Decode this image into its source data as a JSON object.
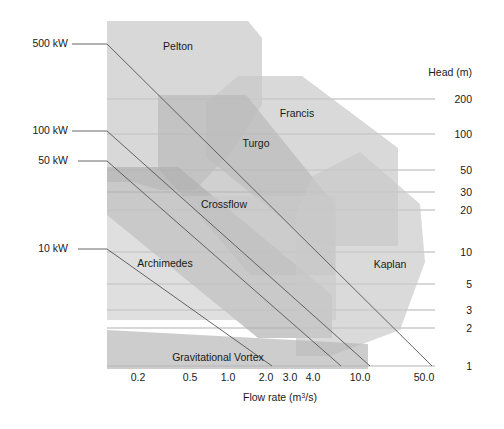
{
  "chart_data": {
    "type": "area",
    "title": "",
    "xlabel": "Flow rate (m3/s)",
    "ylabel": "Head (m)",
    "xlabel_prefix": "Flow rate (m",
    "xlabel_sup": "3",
    "xlabel_suffix": "/s)",
    "x_scale": "log",
    "y_scale": "log",
    "xlim": [
      0.12,
      80
    ],
    "ylim": [
      0.8,
      400
    ],
    "grid": true,
    "legend": "none",
    "x_ticks": [
      {
        "value": 0.2,
        "label": "0.2",
        "px": 138
      },
      {
        "value": 0.5,
        "label": "0.5",
        "px": 190
      },
      {
        "value": 1.0,
        "label": "1.0",
        "px": 228
      },
      {
        "value": 2.0,
        "label": "2.0",
        "px": 266
      },
      {
        "value": 3.0,
        "label": "3.0",
        "px": 290
      },
      {
        "value": 4.0,
        "label": "4.0",
        "px": 313
      },
      {
        "value": 10.0,
        "label": "10.0",
        "px": 360
      },
      {
        "value": 50.0,
        "label": "50.0",
        "px": 424
      }
    ],
    "y_ticks": [
      {
        "value": 200,
        "label": "200",
        "px": 99
      },
      {
        "value": 100,
        "label": "100",
        "px": 134
      },
      {
        "value": 50,
        "label": "50",
        "px": 170
      },
      {
        "value": 30,
        "label": "30",
        "px": 192
      },
      {
        "value": 20,
        "label": "20",
        "px": 210
      },
      {
        "value": 10,
        "label": "10",
        "px": 252
      },
      {
        "value": 5,
        "label": "5",
        "px": 284
      },
      {
        "value": 3,
        "label": "3",
        "px": 310
      },
      {
        "value": 2,
        "label": "2",
        "px": 328
      },
      {
        "value": 1,
        "label": "1",
        "px": 366
      }
    ],
    "power_lines": [
      {
        "label": "500 kW",
        "label_px": {
          "x": 68,
          "y": 47
        },
        "leader": [
          [
            72,
            44
          ],
          [
            107,
            44
          ]
        ],
        "line": [
          [
            107,
            44
          ],
          [
            432,
            366
          ]
        ]
      },
      {
        "label": "100 kW",
        "label_px": {
          "x": 68,
          "y": 134
        },
        "leader": [
          [
            72,
            131
          ],
          [
            107,
            131
          ]
        ],
        "line": [
          [
            107,
            131
          ],
          [
            370,
            366
          ]
        ]
      },
      {
        "label": "50 kW",
        "label_px": {
          "x": 68,
          "y": 164
        },
        "leader": [
          [
            78,
            161
          ],
          [
            107,
            161
          ]
        ],
        "line": [
          [
            107,
            161
          ],
          [
            341,
            366
          ]
        ]
      },
      {
        "label": "10 kW",
        "label_px": {
          "x": 68,
          "y": 252
        },
        "leader": [
          [
            78,
            249
          ],
          [
            107,
            249
          ]
        ],
        "line": [
          [
            107,
            249
          ],
          [
            272,
            366
          ]
        ]
      }
    ],
    "regions": [
      {
        "name": "Pelton",
        "label": "Pelton",
        "label_px": {
          "x": 178,
          "y": 50
        },
        "fill": "#c9c9c9",
        "opacity": 0.72,
        "points": "107,21 248,21 262,38 262,105 233,150 195,190 160,190 132,182 107,182"
      },
      {
        "name": "Francis",
        "label": "Francis",
        "label_px": {
          "x": 297,
          "y": 117
        },
        "fill": "#c9c9c9",
        "opacity": 0.7,
        "points": "238,76 302,76 398,148 398,246 316,246 206,157 206,103"
      },
      {
        "name": "Turgo",
        "label": "Turgo",
        "label_px": {
          "x": 256,
          "y": 147
        },
        "fill": "#b8b8b8",
        "opacity": 0.66,
        "points": "158,95 246,95 335,205 335,275 250,275 158,168"
      },
      {
        "name": "Crossflow",
        "label": "Crossflow",
        "label_px": {
          "x": 224,
          "y": 208
        },
        "fill": "#b0b0b0",
        "opacity": 0.68,
        "points": "107,167 178,167 332,295 332,338 258,338 107,215"
      },
      {
        "name": "Kaplan",
        "label": "Kaplan",
        "label_px": {
          "x": 390,
          "y": 268
        },
        "fill": "#c9c9c9",
        "opacity": 0.68,
        "points": "313,176 360,152 420,204 425,262 400,330 330,356 296,356 296,212"
      },
      {
        "name": "Archimedes",
        "label": "Archimedes",
        "label_px": {
          "x": 165,
          "y": 267
        },
        "fill": "#c9c9c9",
        "opacity": 0.6,
        "points": "107,196 336,196 336,320 107,320"
      },
      {
        "name": "Gravitational Vortex",
        "label": "Gravitational Vortex",
        "label_px": {
          "x": 218,
          "y": 361
        },
        "fill": "#b8b8b8",
        "opacity": 0.7,
        "points": "107,330 368,344 368,369 107,369"
      }
    ]
  }
}
